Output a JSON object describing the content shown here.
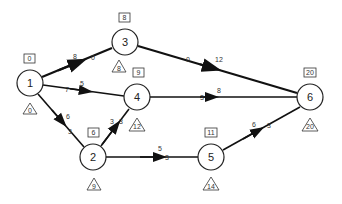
{
  "diagram": {
    "type": "activity-network",
    "nodes": [
      {
        "id": "1",
        "label": "1",
        "x": 30,
        "y": 83,
        "earliest": "0",
        "latest": "0"
      },
      {
        "id": "2",
        "label": "2",
        "x": 93,
        "y": 157,
        "earliest": "6",
        "latest": "9"
      },
      {
        "id": "3",
        "label": "3",
        "x": 125,
        "y": 42,
        "earliest": "8",
        "latest": "8"
      },
      {
        "id": "4",
        "label": "4",
        "x": 137,
        "y": 97,
        "earliest": "9",
        "latest": "12"
      },
      {
        "id": "5",
        "label": "5",
        "x": 211,
        "y": 157,
        "earliest": "11",
        "latest": "14"
      },
      {
        "id": "6",
        "label": "6",
        "x": 310,
        "y": 97,
        "earliest": "20",
        "latest": "20"
      }
    ],
    "edges": [
      {
        "from": "1",
        "to": "3",
        "duration": "8",
        "float": "0",
        "critical": true
      },
      {
        "from": "1",
        "to": "4",
        "duration": "5",
        "float": "7",
        "critical": false
      },
      {
        "from": "1",
        "to": "2",
        "duration": "6",
        "float": "3",
        "critical": false
      },
      {
        "from": "2",
        "to": "4",
        "duration": "3",
        "float": "3",
        "critical": false
      },
      {
        "from": "2",
        "to": "5",
        "duration": "5",
        "float": "3",
        "critical": false
      },
      {
        "from": "3",
        "to": "6",
        "duration": "12",
        "float": "0",
        "critical": true
      },
      {
        "from": "4",
        "to": "6",
        "duration": "8",
        "float": "3",
        "critical": false
      },
      {
        "from": "5",
        "to": "6",
        "duration": "6",
        "float": "3",
        "critical": false
      }
    ]
  }
}
